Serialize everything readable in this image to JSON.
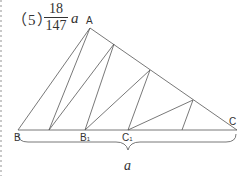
{
  "problem": {
    "number": "（5）",
    "answer_numerator": "18",
    "answer_denominator": "147",
    "answer_variable": "a"
  },
  "figure": {
    "vertices": {
      "A": {
        "label": "A",
        "x": 90,
        "y": 28
      },
      "B": {
        "label": "B",
        "x": 18,
        "y": 130
      },
      "C": {
        "label": "C",
        "x": 237,
        "y": 130
      }
    },
    "base_points": [
      {
        "label": "",
        "x": 49
      },
      {
        "label": "B",
        "sub": "1",
        "x": 85
      },
      {
        "label": "C",
        "sub": "1",
        "x": 128
      },
      {
        "label": "",
        "x": 182
      }
    ],
    "side_points": [
      {
        "x": 114,
        "y": 44
      },
      {
        "x": 150,
        "y": 70
      },
      {
        "x": 193,
        "y": 100
      }
    ],
    "brace_label": "a",
    "line_color": "#555555"
  }
}
